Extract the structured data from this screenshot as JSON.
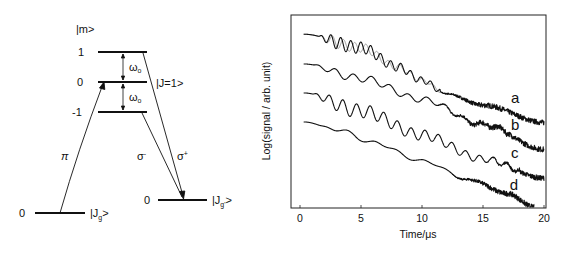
{
  "diagram": {
    "m_header": "|m>",
    "upper_levels": [
      {
        "m": "1",
        "y": 52
      },
      {
        "m": "0",
        "y": 82
      },
      {
        "m": "-1",
        "y": 112
      }
    ],
    "upper_x": [
      98,
      147
    ],
    "upper_state_label": "|J=1>",
    "omega_label": "ω",
    "omega_sub": "o",
    "ground_level": {
      "m": "0",
      "label": "|J",
      "sub": "g",
      "close": ">",
      "y": 213,
      "x": [
        35,
        85
      ]
    },
    "final_level": {
      "m": "0",
      "label": "|J",
      "sub": "g'",
      "close": ">",
      "y": 200,
      "x": [
        158,
        207
      ]
    },
    "transitions": [
      {
        "name": "pi",
        "label": "π",
        "sup": ""
      },
      {
        "name": "sigma-minus",
        "label": "σ",
        "sup": "-"
      },
      {
        "name": "sigma-plus",
        "label": "σ",
        "sup": "+"
      }
    ]
  },
  "chart_data": {
    "type": "line",
    "title": "",
    "xlabel": "Time/μs",
    "ylabel": "Log(signal / arb. unit)",
    "xlim": [
      0,
      20
    ],
    "ylim": [
      0,
      10
    ],
    "xticks": [
      0,
      5,
      10,
      15,
      20
    ],
    "yticks": [],
    "grid": false,
    "legend": "inline labels at right end of curves",
    "series": [
      {
        "name": "a",
        "color": "#111111",
        "baseline": [
          [
            0.3,
            9.0
          ],
          [
            5,
            8.3
          ],
          [
            8,
            7.3
          ],
          [
            10,
            6.6
          ],
          [
            12,
            5.9
          ],
          [
            15,
            5.3
          ],
          [
            20,
            4.4
          ]
        ],
        "oscillation": {
          "start": 1.5,
          "end": 11.5,
          "period": 0.82,
          "amplitude": 0.38,
          "decay_to": 0.35
        },
        "noise_after": 11,
        "label_pos": [
          17.3,
          5.4
        ]
      },
      {
        "name": "a-fit",
        "color": "#9a9a9a",
        "baseline": [
          [
            0.3,
            9.0
          ],
          [
            5,
            8.3
          ],
          [
            8,
            7.3
          ],
          [
            10,
            6.6
          ],
          [
            12,
            5.9
          ],
          [
            15,
            5.3
          ],
          [
            20,
            4.4
          ]
        ],
        "oscillation": {
          "start": 1.5,
          "end": 11.5,
          "period": 0.92,
          "amplitude": 0.33,
          "decay_to": 0.2
        },
        "noise_after": 99,
        "label_pos": null
      },
      {
        "name": "b",
        "color": "#111111",
        "baseline": [
          [
            0.3,
            7.45
          ],
          [
            5,
            6.7
          ],
          [
            10,
            5.6
          ],
          [
            15,
            4.3
          ],
          [
            20,
            3.0
          ]
        ],
        "oscillation": {
          "start": 1.0,
          "end": 17,
          "period": 1.5,
          "amplitude": 0.22,
          "decay_to": 0.4
        },
        "noise_after": 11,
        "label_pos": [
          17.3,
          4.0
        ]
      },
      {
        "name": "c",
        "color": "#111111",
        "baseline": [
          [
            0.3,
            5.94
          ],
          [
            5,
            5.0
          ],
          [
            10,
            3.75
          ],
          [
            15,
            2.5
          ],
          [
            20,
            1.5
          ]
        ],
        "oscillation": {
          "start": 1.0,
          "end": 18,
          "period": 1.12,
          "amplitude": 0.42,
          "decay_to": 0.3
        },
        "noise_after": 15,
        "label_pos": [
          17.3,
          2.55
        ]
      },
      {
        "name": "d",
        "color": "#111111",
        "baseline": [
          [
            0.3,
            4.43
          ],
          [
            3,
            4.05
          ],
          [
            6,
            3.35
          ],
          [
            10,
            2.4
          ],
          [
            14,
            1.4
          ],
          [
            17,
            0.7
          ],
          [
            19.2,
            0.0
          ]
        ],
        "oscillation": {
          "start": 1.5,
          "end": 14,
          "period": 2.0,
          "amplitude": 0.1,
          "decay_to": 0.5
        },
        "noise_after": 12,
        "label_pos": [
          17.2,
          0.9
        ]
      }
    ]
  }
}
